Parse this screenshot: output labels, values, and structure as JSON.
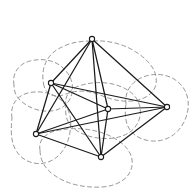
{
  "figure": {
    "caption": "",
    "width": 196,
    "height": 196,
    "background_color": "#ffffff"
  },
  "style": {
    "edge_color": "#1b1b1b",
    "edge_width": 1.25,
    "vertex_fill": "#ffffff",
    "vertex_stroke": "#1b1b1b",
    "vertex_radius": 2.6,
    "blob_color": "#8a8a8a",
    "blob_width": 0.9,
    "blob_dash": "4 3.2"
  },
  "chart_data": {
    "type": "diagram",
    "subtitle": "",
    "xlabel": "",
    "ylabel": "",
    "grid": false,
    "legend": "none",
    "xlim": [
      0,
      196
    ],
    "ylim": [
      0,
      196
    ],
    "graph": {
      "kind": "complete-graph",
      "vertex_count": 6,
      "edge_count": 15,
      "vertices": [
        {
          "id": "v1",
          "label": "top",
          "x": 92,
          "y": 39
        },
        {
          "id": "v2",
          "label": "upper-left",
          "x": 51,
          "y": 83
        },
        {
          "id": "v3",
          "label": "lower-left",
          "x": 36,
          "y": 134
        },
        {
          "id": "v4",
          "label": "center",
          "x": 108,
          "y": 109
        },
        {
          "id": "v5",
          "label": "bottom",
          "x": 101,
          "y": 157
        },
        {
          "id": "v6",
          "label": "right",
          "x": 167,
          "y": 107
        }
      ],
      "edges": [
        [
          "v1",
          "v2"
        ],
        [
          "v1",
          "v3"
        ],
        [
          "v1",
          "v4"
        ],
        [
          "v1",
          "v5"
        ],
        [
          "v1",
          "v6"
        ],
        [
          "v2",
          "v3"
        ],
        [
          "v2",
          "v4"
        ],
        [
          "v2",
          "v5"
        ],
        [
          "v2",
          "v6"
        ],
        [
          "v3",
          "v4"
        ],
        [
          "v3",
          "v5"
        ],
        [
          "v3",
          "v6"
        ],
        [
          "v4",
          "v5"
        ],
        [
          "v4",
          "v6"
        ],
        [
          "v5",
          "v6"
        ]
      ]
    },
    "blobs": [
      {
        "id": "blob-top",
        "label": "neighborhood-top",
        "path": "M 44 86 C 40 70 46 54 62 47 C 72 42 82 41 92 41 C 108 40 124 44 136 52 C 150 61 158 72 156 84 C 154 94 144 100 132 101 C 120 102 110 99 100 95 C 88 90 76 90 66 94 C 56 98 47 96 44 86 Z"
      },
      {
        "id": "blob-upper-left",
        "label": "neighborhood-upper-left",
        "path": "M 14 85 C 12 74 18 64 30 61 C 42 58 54 60 62 67 C 70 74 74 83 72 93 C 70 103 62 110 51 111 C 40 112 28 108 20 100 C 15 95 14 90 14 85 Z"
      },
      {
        "id": "blob-lower-left",
        "label": "neighborhood-lower-left",
        "path": "M 12 118 C 10 106 16 96 28 93 C 40 90 54 93 62 101 C 70 109 72 120 70 132 C 68 146 60 158 48 162 C 36 166 24 162 17 152 C 10 142 11 128 12 118 Z"
      },
      {
        "id": "blob-center",
        "label": "neighborhood-center",
        "path": "M 66 106 C 64 96 70 88 82 85 C 96 81 112 82 124 88 C 136 94 142 104 140 116 C 138 128 128 136 114 138 C 98 140 82 136 72 127 C 66 121 65 113 66 106 Z"
      },
      {
        "id": "blob-bottom",
        "label": "neighborhood-bottom",
        "path": "M 40 150 C 38 140 46 132 60 130 C 76 127 94 129 108 135 C 124 142 134 153 132 166 C 130 178 118 186 102 187 C 84 188 66 184 54 175 C 44 168 40 159 40 150 Z"
      },
      {
        "id": "blob-right",
        "label": "neighborhood-right",
        "path": "M 126 104 C 124 92 132 80 146 76 C 160 72 174 76 182 86 C 190 96 190 110 184 122 C 178 134 166 142 152 141 C 138 140 128 132 126 120 C 125 114 125 109 126 104 Z"
      }
    ]
  }
}
